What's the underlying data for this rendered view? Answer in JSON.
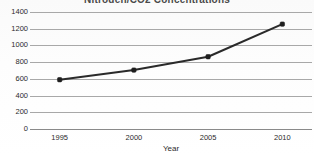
{
  "chart_data": {
    "type": "line",
    "title": "Nitrogen/CO2 Concentrations",
    "title_clipped": true,
    "xlabel": "Year",
    "ylabel": "",
    "x": [
      1995,
      2000,
      2005,
      2010
    ],
    "categories": [
      "1995",
      "2000",
      "2005",
      "2010"
    ],
    "series": [
      {
        "name": "Concentration",
        "values": [
          590,
          705,
          865,
          1255
        ]
      }
    ],
    "xlim": [
      1993,
      2012
    ],
    "ylim": [
      0,
      1400
    ],
    "yticks": [
      0,
      200,
      400,
      600,
      800,
      1000,
      1200,
      1400
    ],
    "ytick_labels": [
      "0",
      "200",
      "400",
      "600",
      "800",
      "1000",
      "1200",
      "1400"
    ],
    "xticks": [
      1995,
      2000,
      2005,
      2010
    ],
    "xtick_labels": [
      "1995",
      "2000",
      "2005",
      "2010"
    ],
    "grid": true,
    "grid_axis": "y",
    "legend": false,
    "legend_position": "none",
    "markers": "square",
    "colors": {
      "line": "#2a2a2a",
      "marker": "#1e1e1e",
      "grid": "#a8a8a8",
      "axis": "#8a8a8a",
      "background": "#fdfdfd",
      "text": "#2b2b2b",
      "title": "#4a4a4a"
    }
  }
}
